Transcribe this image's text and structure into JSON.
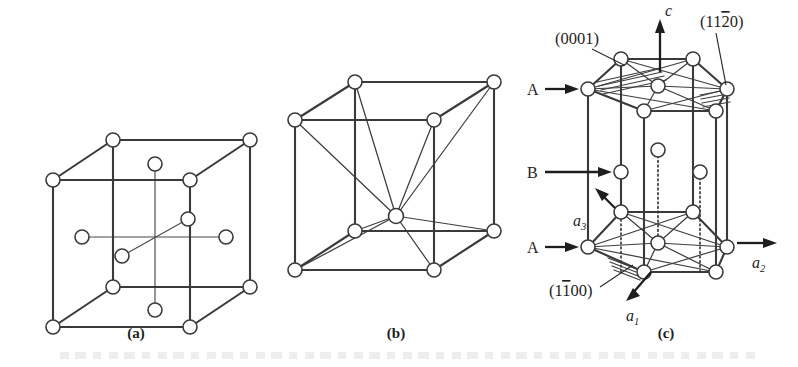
{
  "figure": {
    "background_color": "#ffffff",
    "line_color": "#3a3a3a",
    "atom_fill_color": "#ffffff",
    "text_color": "#1e1e1e"
  },
  "panels": [
    {
      "id": "a",
      "caption": "(a)",
      "structure_name": "face-centered cubic",
      "atom_count_corners": 8,
      "atom_count_faces": 6
    },
    {
      "id": "b",
      "caption": "(b)",
      "structure_name": "body-centered cubic",
      "atom_count_corners": 8,
      "atom_count_center": 1
    },
    {
      "id": "c",
      "caption": "(c)",
      "structure_name": "hexagonal close-packed",
      "plane_labels": [
        {
          "key": "basal",
          "text_parts": [
            "(0001)"
          ]
        },
        {
          "key": "prism_a",
          "text_parts": [
            "(11",
            "2",
            "0)"
          ],
          "overbar_index": 1
        },
        {
          "key": "prism_m",
          "text_parts": [
            "(1",
            "1",
            "00)"
          ],
          "overbar_index": 1
        }
      ],
      "layer_labels": [
        {
          "key": "top",
          "text": "A"
        },
        {
          "key": "middle",
          "text": "B"
        },
        {
          "key": "bottom",
          "text": "A"
        }
      ],
      "axis_labels": [
        {
          "key": "c",
          "base": "c",
          "sub": ""
        },
        {
          "key": "a1",
          "base": "a",
          "sub": "1"
        },
        {
          "key": "a2",
          "base": "a",
          "sub": "2"
        },
        {
          "key": "a3",
          "base": "a",
          "sub": "3"
        }
      ]
    }
  ]
}
